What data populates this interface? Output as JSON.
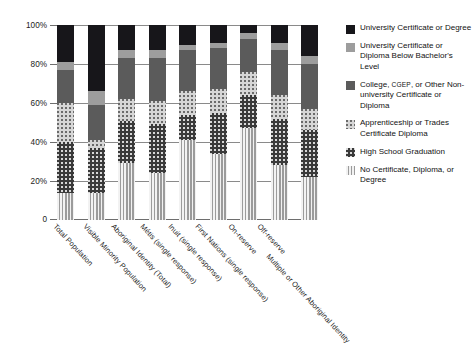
{
  "chart_data": {
    "type": "bar",
    "subtype": "stacked-100-percent",
    "title": "",
    "xlabel": "",
    "ylabel": "",
    "ylim": [
      0,
      100
    ],
    "ytick_labels": [
      "0",
      "20%",
      "40%",
      "60%",
      "80%",
      "100%"
    ],
    "ytick_values": [
      0,
      20,
      40,
      60,
      80,
      100
    ],
    "grid": true,
    "legend_position": "right",
    "categories": [
      "Total Population",
      "Visible Minority Population",
      "Aboriginal Identity (Total)",
      "Métis (single response)",
      "Inuit (single response)",
      "First Nations (single response)",
      "On-reserve",
      "Off-reserve",
      "Multiple or Other Aboriginal Identity"
    ],
    "series": [
      {
        "name": "No Certificate, Diploma, or Degree",
        "key": "nocert",
        "color": "#c9c9c9",
        "values": [
          14,
          14,
          29,
          24,
          41,
          34,
          47,
          28,
          22
        ]
      },
      {
        "name": "High School Graduation",
        "key": "hs",
        "color": "#3a3a3a",
        "values": [
          26,
          23,
          22,
          25,
          13,
          21,
          17,
          24,
          24
        ]
      },
      {
        "name": "Apprenticeship or Trades Certificate Diploma",
        "key": "appr",
        "color": "#d6d6d6",
        "values": [
          20,
          4,
          11,
          12,
          12,
          12,
          12,
          12,
          11
        ]
      },
      {
        "name": "College, CGEP, or Other Non-university Certificate or Diploma",
        "key": "college",
        "color": "#5b5b5b",
        "values": [
          17,
          18,
          21,
          22,
          21,
          21,
          17,
          23,
          23
        ]
      },
      {
        "name": "University Certificate or Diploma Below Bachelor's Level",
        "key": "univbel",
        "color": "#9d9d9d",
        "values": [
          4,
          7,
          4,
          4,
          3,
          3,
          3,
          4,
          4
        ]
      },
      {
        "name": "University Certificate or Degree",
        "key": "univdeg",
        "color": "#17161a",
        "values": [
          19,
          34,
          13,
          13,
          10,
          9,
          4,
          9,
          16
        ]
      }
    ]
  },
  "legend": {
    "items": [
      {
        "swatch": "f-univdeg",
        "label": "University Certificate or Degree"
      },
      {
        "swatch": "f-univbel",
        "label": "University Certificate or Diploma Below Bachelor's Level"
      },
      {
        "swatch": "f-college",
        "label_pre": "College, ",
        "label_sc": "CGEP",
        "label_post": ", or Other Non-university Certificate or Diploma"
      },
      {
        "swatch": "f-appr",
        "label": "Apprenticeship or Trades Certificate Diploma"
      },
      {
        "swatch": "f-hs",
        "label": "High School Graduation"
      },
      {
        "swatch": "f-nocert",
        "label": "No Certificate, Diploma, or Degree"
      }
    ]
  }
}
